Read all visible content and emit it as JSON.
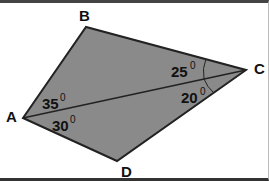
{
  "diagram": {
    "type": "quadrilateral-with-diagonal",
    "fill_color": "#8a8a8a",
    "stroke_color": "#222222",
    "vertices": [
      {
        "label": "A",
        "x": 23,
        "y": 118
      },
      {
        "label": "B",
        "x": 86,
        "y": 27
      },
      {
        "label": "C",
        "x": 246,
        "y": 70
      },
      {
        "label": "D",
        "x": 117,
        "y": 161
      }
    ],
    "diagonal": {
      "from": "A",
      "to": "C"
    },
    "angles": [
      {
        "at": "A",
        "between": "AB-AC",
        "value": "35",
        "unit": "0"
      },
      {
        "at": "A",
        "between": "AC-AD",
        "value": "30",
        "unit": "0"
      },
      {
        "at": "C",
        "between": "CB-CA",
        "value": "25",
        "unit": "0"
      },
      {
        "at": "C",
        "between": "CA-CD",
        "value": "20",
        "unit": "0"
      }
    ]
  }
}
